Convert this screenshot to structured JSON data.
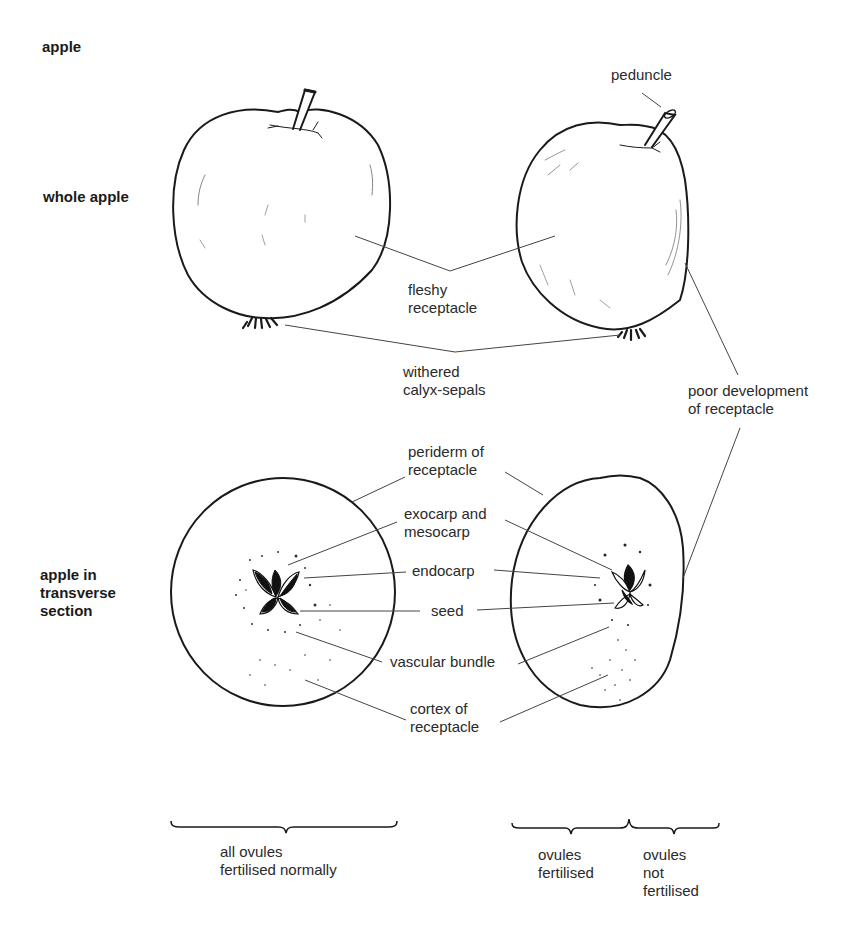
{
  "figure": {
    "top_cutoff_text": "",
    "section_title": "apple",
    "row_labels": {
      "whole": "whole apple",
      "section": "apple in\ntransverse\nsection"
    },
    "labels": {
      "peduncle": "peduncle",
      "fleshy_receptacle": "fleshy\nreceptacle",
      "withered_calyx": "withered\ncalyx-sepals",
      "poor_development": "poor development\nof receptacle",
      "periderm": "periderm of\nreceptacle",
      "exocarp": "exocarp and\nmesocarp",
      "endocarp": "endocarp",
      "seed": "seed",
      "vascular_bundle": "vascular bundle",
      "cortex": "cortex of\nreceptacle"
    },
    "bracket_labels": {
      "all": "all ovules\nfertilised normally",
      "fertilised": "ovules\nfertilised",
      "not_fertilised": "ovules\nnot\nfertilised"
    },
    "colors": {
      "ink": "#1a1a1a",
      "leader": "#444444",
      "background": "#ffffff"
    }
  }
}
